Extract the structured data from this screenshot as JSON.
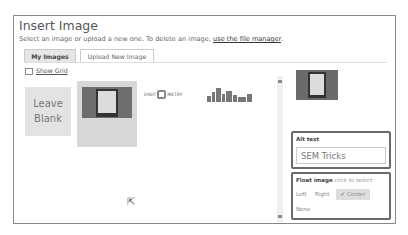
{
  "dialog": {
    "title": "Insert Image",
    "subtitle_text": "Select an image or upload a new one. To delete an image,",
    "subtitle_link": "use the file manager",
    "subtitle_end": "."
  },
  "tabs": [
    {
      "label": "My Images",
      "active": true
    },
    {
      "label": "Upload New Image",
      "active": false
    }
  ],
  "show_grid": {
    "label": "Show Grid",
    "checked": false
  },
  "images": [
    {
      "type": "leave-blank",
      "label": "Leave Blank"
    },
    {
      "type": "thumbnail",
      "description": "screenshot thumbnail",
      "selected": true
    },
    {
      "type": "thumbnail",
      "description": "Digitometry logo",
      "text_left": "DIGIT",
      "text_right": "METRY"
    },
    {
      "type": "thumbnail",
      "description": "city skyline logo"
    }
  ],
  "sidebar": {
    "alt_text": {
      "label": "Alt text",
      "value": "SEM Tricks"
    },
    "float_image": {
      "label": "Float image",
      "hint": "click to select",
      "options": [
        "Left",
        "Right",
        "Center",
        "None"
      ],
      "selected": "Center",
      "check_glyph": "✔"
    }
  },
  "cursor_glyph": "⇱"
}
